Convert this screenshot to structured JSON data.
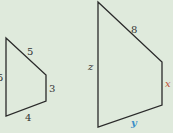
{
  "colors": {
    "background": "#dfeadc",
    "edge": "#2a2a2a",
    "label": "#333333",
    "x_label": "#c0503a",
    "y_label": "#3a8fc8"
  },
  "small_quadrilateral": {
    "vertices": [
      [
        6,
        38
      ],
      [
        46,
        75
      ],
      [
        46,
        101
      ],
      [
        6,
        116
      ]
    ],
    "labels": {
      "left": "5",
      "top": "5",
      "right": "3",
      "bottom": "4"
    }
  },
  "large_quadrilateral": {
    "vertices": [
      [
        98,
        2
      ],
      [
        162,
        62
      ],
      [
        162,
        105
      ],
      [
        98,
        127
      ]
    ],
    "labels": {
      "left": "z",
      "top": "8",
      "right": "x",
      "bottom": "y"
    }
  }
}
